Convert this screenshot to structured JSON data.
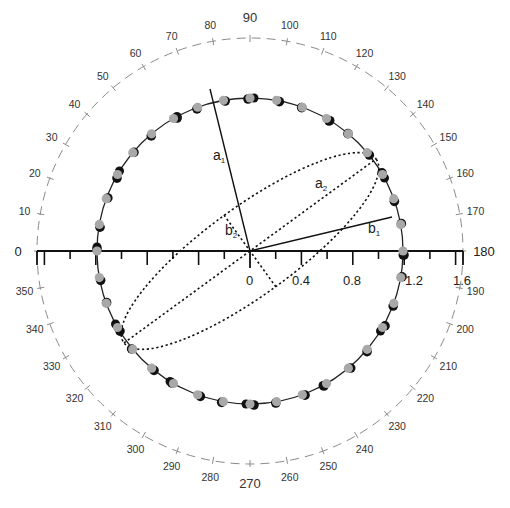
{
  "diagram": {
    "type": "polar-ellipse-diagram",
    "center_label": "0",
    "angle_labels": [
      "0",
      "10",
      "20",
      "30",
      "40",
      "50",
      "60",
      "70",
      "80",
      "90",
      "100",
      "110",
      "120",
      "130",
      "140",
      "150",
      "160",
      "170",
      "180",
      "190",
      "200",
      "210",
      "220",
      "230",
      "240",
      "250",
      "260",
      "270",
      "280",
      "290",
      "300",
      "310",
      "320",
      "330",
      "340",
      "350"
    ],
    "axis_tick_labels": [
      "0.4",
      "0.8",
      "1.2",
      "1.6"
    ],
    "segment_labels": {
      "a1": "a",
      "a1_sub": "1",
      "a2": "a",
      "a2_sub": "2",
      "b1": "b",
      "b1_sub": "1",
      "b2": "b",
      "b2_sub": "2"
    },
    "colors": {
      "circle": "#222222",
      "outer_dashed": "#8a8a8a",
      "dot_light": "#a8a8a8",
      "dot_dark": "#111111",
      "axis": "#111111"
    }
  },
  "chart_data": {
    "type": "polar",
    "title": "",
    "angular_axis": {
      "range": [
        0,
        360
      ],
      "step": 10,
      "zero_direction": "left",
      "direction": "clockwise"
    },
    "radial_axis": {
      "ticks": [
        0,
        0.4,
        0.8,
        1.2,
        1.6
      ]
    },
    "circle_radius": 1.19,
    "ellipse": {
      "semi_major": 1.21,
      "semi_minor": 0.34,
      "major_axis_angle_deg": 144
    },
    "lines": [
      {
        "name": "a1",
        "angle_deg": 75,
        "length": 1.19
      },
      {
        "name": "b1",
        "angle_deg": 167,
        "length": 1.13
      },
      {
        "name": "a2",
        "angle_deg": 144,
        "length": 1.21
      },
      {
        "name": "b2",
        "angle_deg": 54,
        "length": 0.34
      }
    ],
    "data_points_angles_deg": [
      0,
      10,
      20,
      30,
      40,
      50,
      60,
      70,
      80,
      90,
      100,
      110,
      120,
      130,
      140,
      150,
      160,
      170,
      180,
      190,
      200,
      210,
      220,
      230,
      240,
      250,
      260,
      270,
      280,
      290,
      300,
      310,
      320,
      330,
      340,
      350
    ]
  }
}
